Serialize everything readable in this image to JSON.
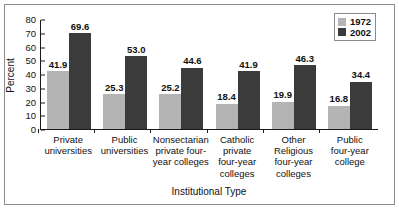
{
  "chart_data": {
    "type": "bar",
    "title": "",
    "xlabel": "Institutional Type",
    "ylabel": "Percent",
    "ylim": [
      0,
      80
    ],
    "yticks": [
      0,
      10,
      20,
      30,
      40,
      50,
      60,
      70,
      80
    ],
    "grid": false,
    "legend_position": "top-right",
    "categories": [
      "Private universities",
      "Public universities",
      "Nonsectarian private four-year colleges",
      "Catholic private four-year colleges",
      "Other Religious four-year colleges",
      "Public four-year college"
    ],
    "category_lines": [
      [
        "Private",
        "universities"
      ],
      [
        "Public",
        "universities"
      ],
      [
        "Nonsectarian",
        "private four-",
        "year colleges"
      ],
      [
        "Catholic",
        "private",
        "four-year",
        "colleges"
      ],
      [
        "Other",
        "Religious",
        "four-year",
        "colleges"
      ],
      [
        "Public",
        "four-year",
        "college"
      ]
    ],
    "series": [
      {
        "name": "1972",
        "color": "#b4b4b4",
        "values": [
          41.9,
          25.3,
          25.2,
          18.4,
          19.9,
          16.8
        ],
        "labels": [
          "41.9",
          "25.3",
          "25.2",
          "18.4",
          "19.9",
          "16.8"
        ]
      },
      {
        "name": "2002",
        "color": "#3b3b3b",
        "values": [
          69.6,
          53.0,
          44.6,
          41.9,
          46.3,
          34.4
        ],
        "labels": [
          "69.6",
          "53.0",
          "44.6",
          "41.9",
          "46.3",
          "34.4"
        ]
      }
    ]
  }
}
